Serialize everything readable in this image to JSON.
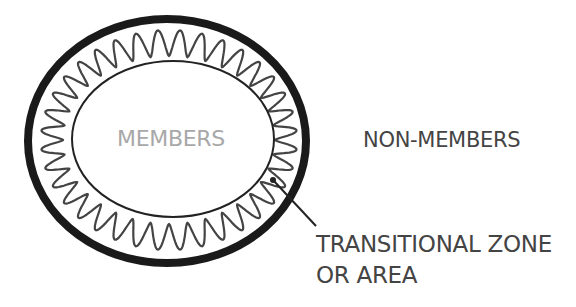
{
  "diagram": {
    "labels": {
      "inner": "MEMBERS",
      "outer": "NON-MEMBERS",
      "zone_line1": "TRANSITIONAL ZONE",
      "zone_line2": "OR AREA"
    },
    "colors": {
      "outer_ring": "#1a1a1a",
      "wave": "#444444",
      "inner_ellipse": "#222222",
      "members_text": "#a8a8a8",
      "label_text": "#444444"
    },
    "shapes": {
      "outer_ellipse": {
        "cx": 167,
        "cy": 141,
        "rx": 139,
        "ry": 122,
        "stroke_width": 8
      },
      "inner_ellipse": {
        "cx": 173,
        "cy": 139,
        "rx": 101,
        "ry": 78,
        "stroke_width": 2
      },
      "wave_ring": {
        "peaks": 36
      },
      "leader_line": {
        "x1": 273,
        "y1": 180,
        "x2": 316,
        "y2": 226
      }
    }
  }
}
